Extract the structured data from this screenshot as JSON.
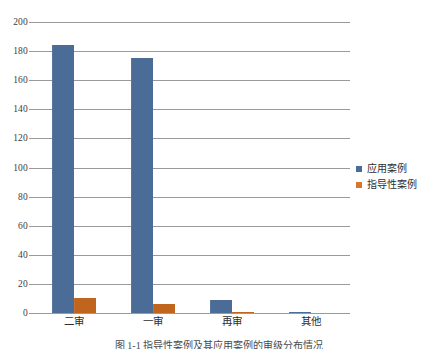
{
  "chart_data": {
    "type": "bar",
    "title": "",
    "subtitle": "",
    "xlabel": "",
    "ylabel": "",
    "categories": [
      "二审",
      "一审",
      "再审",
      "其他"
    ],
    "series": [
      {
        "name": "应用案例",
        "color": "#4A6C96",
        "values": [
          184,
          175,
          9,
          1
        ]
      },
      {
        "name": "指导性案例",
        "color": "#C0651E",
        "values": [
          10,
          6,
          1,
          0
        ]
      }
    ],
    "ylim": [
      0,
      200
    ],
    "ytick_labels": [
      "200",
      "180",
      "160",
      "140",
      "120",
      "100",
      "80",
      "60",
      "40",
      "20",
      "0"
    ],
    "ytick_values": [
      200,
      180,
      160,
      140,
      120,
      100,
      80,
      60,
      40,
      20,
      0
    ],
    "grid": true,
    "grid_color": "#9a9a9a",
    "legend_position": "right",
    "legend": [
      "应用案例",
      "指导性案例"
    ]
  },
  "caption": {
    "text": "图 1-1  指导性案例及其应用案例的审级分布情况"
  }
}
